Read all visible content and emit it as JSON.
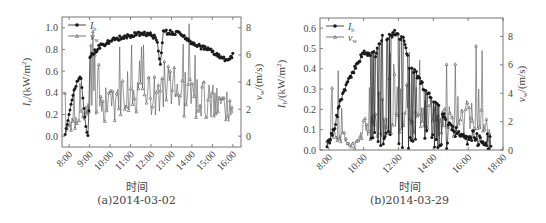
{
  "chart_data": [
    {
      "id": "a",
      "type": "line",
      "caption": "(a)2014-03-02",
      "xlabel": "时间",
      "ylabel_left": "I_b/(kW/m²)",
      "ylabel_right": "v_w/(m/s)",
      "legend": [
        "I_b",
        "v_w"
      ],
      "legend_position": "upper left",
      "grid": false,
      "x_ticks": [
        "8:00",
        "9:00",
        "10:00",
        "11:00",
        "12:00",
        "13:00",
        "14:00",
        "15:00",
        "16:00"
      ],
      "xlim_hours": [
        7.65,
        16.4
      ],
      "ylim_left": [
        -0.1,
        1.1
      ],
      "y_ticks_left": [
        "0.0",
        "0.2",
        "0.4",
        "0.6",
        "0.8",
        "1.0"
      ],
      "ylim_right": [
        -0.8,
        8.8
      ],
      "y_ticks_right": [
        "0",
        "2",
        "4",
        "6",
        "8"
      ],
      "series": [
        {
          "name": "I_b",
          "axis": "left",
          "marker": "filled-circle",
          "x": [
            7.8,
            8.0,
            8.2,
            8.4,
            8.55,
            8.7,
            8.85,
            8.95,
            9.0,
            9.5,
            10.0,
            10.5,
            11.0,
            11.5,
            12.0,
            12.3,
            12.45,
            12.6,
            13.0,
            13.5,
            13.8,
            14.0,
            14.5,
            15.0,
            15.3,
            15.5,
            15.8,
            16.0
          ],
          "y": [
            0.0,
            0.22,
            0.4,
            0.5,
            0.57,
            0.3,
            0.05,
            0.01,
            0.74,
            0.83,
            0.88,
            0.91,
            0.93,
            0.95,
            0.94,
            0.9,
            0.65,
            0.96,
            0.96,
            0.95,
            0.88,
            0.86,
            0.82,
            0.78,
            0.74,
            0.71,
            0.72,
            0.75
          ]
        },
        {
          "name": "v_w",
          "axis": "right",
          "marker": "open-triangle",
          "x": [
            7.8,
            8.0,
            8.3,
            8.6,
            8.9,
            9.2,
            9.5,
            10.0,
            10.5,
            11.0,
            11.5,
            12.0,
            12.5,
            13.0,
            13.5,
            14.0,
            14.5,
            15.0,
            15.5,
            16.0
          ],
          "y": [
            0.2,
            0.8,
            1.2,
            1.4,
            1.6,
            2.2,
            2.4,
            2.3,
            2.6,
            2.9,
            2.7,
            3.2,
            3.8,
            3.5,
            3.3,
            2.9,
            2.7,
            2.6,
            2.3,
            2.0
          ],
          "spikes_max": [
            7.8,
            6.0,
            5.0,
            4.0
          ]
        }
      ]
    },
    {
      "id": "b",
      "type": "line",
      "caption": "(b)2014-03-29",
      "xlabel": "时间",
      "ylabel_left": "I_b/(kW/m²)",
      "ylabel_right": "v_w/(m/s)",
      "legend": [
        "I_b",
        "v_w"
      ],
      "legend_position": "upper left",
      "grid": false,
      "x_ticks": [
        "8:00",
        "10:00",
        "12:00",
        "14:00",
        "16:00",
        "18:00"
      ],
      "xlim_hours": [
        7.5,
        18.0
      ],
      "ylim_left": [
        0.0,
        0.65
      ],
      "y_ticks_left": [
        "0.0",
        "0.1",
        "0.2",
        "0.3",
        "0.4",
        "0.5",
        "0.6"
      ],
      "ylim_right": [
        0,
        9.3
      ],
      "y_ticks_right": [
        "0",
        "2",
        "4",
        "6",
        "8"
      ],
      "series": [
        {
          "name": "I_b",
          "axis": "left",
          "marker": "filled-circle",
          "x": [
            7.9,
            8.3,
            8.6,
            8.9,
            9.2,
            9.5,
            9.8,
            10.0,
            10.3,
            10.7,
            11.0,
            11.5,
            11.8,
            12.0,
            12.3,
            12.6,
            13.0,
            13.5,
            14.0,
            14.5,
            15.0,
            15.5,
            16.0,
            16.5,
            17.0,
            17.3
          ],
          "y": [
            0.02,
            0.1,
            0.22,
            0.3,
            0.35,
            0.4,
            0.45,
            0.49,
            0.47,
            0.47,
            0.55,
            0.56,
            0.58,
            0.56,
            0.55,
            0.42,
            0.38,
            0.3,
            0.25,
            0.18,
            0.12,
            0.08,
            0.06,
            0.04,
            0.02,
            0.01
          ]
        },
        {
          "name": "v_w",
          "axis": "right",
          "marker": "open-triangle",
          "x": [
            7.9,
            8.3,
            8.6,
            8.9,
            9.2,
            9.5,
            9.8,
            10.0,
            10.3,
            10.7,
            11.0,
            11.5,
            12.0,
            12.5,
            13.0,
            13.5,
            14.0,
            14.5,
            15.0,
            15.5,
            16.0,
            16.5,
            17.0,
            17.3
          ],
          "y": [
            0.4,
            1.0,
            1.4,
            1.0,
            0.4,
            0.3,
            0.9,
            1.4,
            1.6,
            1.8,
            1.5,
            1.6,
            1.8,
            1.9,
            2.1,
            2.4,
            2.0,
            2.2,
            2.0,
            2.1,
            2.4,
            2.0,
            1.8,
            0.8
          ],
          "spikes_max": [
            7.4,
            6.6,
            4.5,
            4.0
          ]
        }
      ]
    }
  ],
  "panels": {
    "a": {
      "caption": "(a)2014-03-02",
      "xlabel": "时间",
      "legend_ib": "I",
      "legend_ib_sub": "b",
      "legend_vw": "v",
      "legend_vw_sub": "w",
      "ylabel_left": "I",
      "ylabel_left_sub": "b",
      "ylabel_left_unit": "/(kW/m",
      "ylabel_right": "v",
      "ylabel_right_sub": "w",
      "ylabel_right_unit": "/(m/s)"
    },
    "b": {
      "caption": "(b)2014-03-29",
      "xlabel": "时间",
      "legend_ib": "I",
      "legend_ib_sub": "b",
      "legend_vw": "v",
      "legend_vw_sub": "w",
      "ylabel_left": "I",
      "ylabel_left_sub": "b",
      "ylabel_left_unit": "/(kW/m",
      "ylabel_right": "v",
      "ylabel_right_sub": "w",
      "ylabel_right_unit": "/(m/s)"
    }
  },
  "colors": {
    "ib": "#1a1a1a",
    "vw": "#555555",
    "axis": "#666666"
  }
}
